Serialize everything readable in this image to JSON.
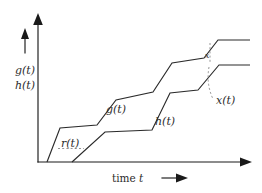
{
  "figure": {
    "title_visible": false,
    "background_color": "#ffffff",
    "ink_color": "#2b2b2b",
    "dashed_color": "#8a8a8a"
  },
  "axes": {
    "y_axis_label_lines": [
      "g(t)",
      "h(t)"
    ],
    "y_axis_direction_icon": "up-arrow-icon",
    "x_axis_label": "time ",
    "x_axis_label_italic": "t",
    "x_axis_direction_icon": "right-arrow-icon",
    "x_origin": 38,
    "y_baseline": 162,
    "x_end": 252,
    "y_top": 18
  },
  "annotations": {
    "g_label": "g(t)",
    "h_label": "h(t)",
    "r_label": "r(t)",
    "x_label": "x(t)",
    "x_small_label": "x"
  },
  "chart_data": {
    "type": "line",
    "title": "",
    "xlabel": "time t",
    "ylabel": "g(t)  h(t)",
    "grid": false,
    "legend": "inline-annotations",
    "xlim": [
      38,
      252
    ],
    "ylim": [
      162,
      18
    ],
    "note": "Pixel-space polylines; y decreases upward in screen coords.",
    "series": [
      {
        "name": "g(t)",
        "points": [
          [
            47,
            162
          ],
          [
            60,
            128
          ],
          [
            97,
            125
          ],
          [
            116,
            100
          ],
          [
            153,
            92
          ],
          [
            172,
            63
          ],
          [
            204,
            58
          ],
          [
            218,
            40
          ],
          [
            250,
            40
          ]
        ]
      },
      {
        "name": "h(t)",
        "points": [
          [
            72,
            162
          ],
          [
            105,
            132
          ],
          [
            152,
            130
          ],
          [
            170,
            93
          ],
          [
            198,
            90
          ],
          [
            219,
            65
          ],
          [
            250,
            65
          ]
        ]
      }
    ],
    "annotations": [
      {
        "text": "g(t)",
        "x": 106,
        "y": 113
      },
      {
        "text": "h(t)",
        "x": 155,
        "y": 124
      },
      {
        "text": "r(t)",
        "x": 62,
        "y": 146
      },
      {
        "text": "x(t)",
        "x": 215,
        "y": 103
      },
      {
        "text": "x",
        "x": 209,
        "y": 65
      }
    ],
    "dashed_markers": [
      {
        "kind": "r-gap-horizontal",
        "from": [
          58,
          148
        ],
        "to": [
          84,
          148
        ]
      },
      {
        "kind": "x-gap-vertical",
        "from": [
          210,
          44
        ],
        "to": [
          210,
          63
        ]
      },
      {
        "kind": "x-callout",
        "from": [
          210,
          66
        ],
        "to": [
          213,
          98
        ]
      }
    ]
  }
}
